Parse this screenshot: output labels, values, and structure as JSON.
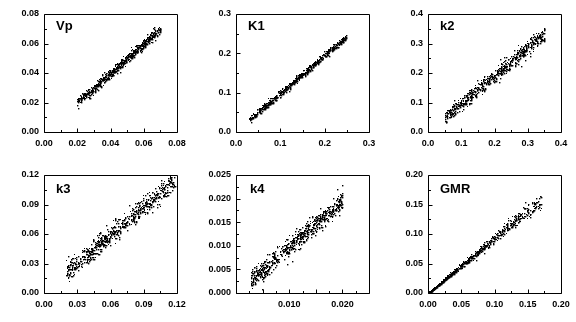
{
  "figure": {
    "kind": "scatter-panel-grid",
    "rows": 2,
    "cols": 3,
    "background": "#ffffff",
    "marker_color": "#000000",
    "axis_color": "#000000"
  },
  "chart_data": [
    {
      "type": "scatter",
      "title": "Vp",
      "xlabel": "",
      "ylabel": "",
      "grid": false,
      "legend": null,
      "xlim": [
        0.0,
        0.08
      ],
      "ylim": [
        0.0,
        0.08
      ],
      "xticks": [
        0.0,
        0.02,
        0.04,
        0.06,
        0.08
      ],
      "yticks": [
        0.0,
        0.02,
        0.04,
        0.06,
        0.08
      ],
      "xticklabels": [
        "0.00",
        "0.02",
        "0.04",
        "0.06",
        "0.08"
      ],
      "yticklabels": [
        "0.00",
        "0.02",
        "0.04",
        "0.06",
        "0.08"
      ],
      "minor_tick_subdivisions": 2,
      "data_x_range": [
        0.02,
        0.07
      ],
      "data_y_range": [
        0.022,
        0.07
      ],
      "slope": 1.0,
      "intercept": 0.0,
      "scatter_sigma": 0.0018,
      "n_points": 620,
      "seed": 11
    },
    {
      "type": "scatter",
      "title": "K1",
      "xlabel": "",
      "ylabel": "",
      "grid": false,
      "legend": null,
      "xlim": [
        0.0,
        0.3
      ],
      "ylim": [
        0.0,
        0.3
      ],
      "xticks": [
        0.0,
        0.1,
        0.2,
        0.3
      ],
      "yticks": [
        0.0,
        0.1,
        0.2,
        0.3
      ],
      "xticklabels": [
        "0.0",
        "0.1",
        "0.2",
        "0.3"
      ],
      "yticklabels": [
        "0.0",
        "0.1",
        "0.2",
        "0.3"
      ],
      "minor_tick_subdivisions": 2,
      "data_x_range": [
        0.03,
        0.248
      ],
      "data_y_range": [
        0.032,
        0.242
      ],
      "slope": 0.965,
      "intercept": 0.003,
      "scatter_sigma": 0.0042,
      "n_points": 620,
      "seed": 23
    },
    {
      "type": "scatter",
      "title": "k2",
      "xlabel": "",
      "ylabel": "",
      "grid": false,
      "legend": null,
      "xlim": [
        0.0,
        0.4
      ],
      "ylim": [
        0.0,
        0.4
      ],
      "xticks": [
        0.0,
        0.1,
        0.2,
        0.3,
        0.4
      ],
      "yticks": [
        0.0,
        0.1,
        0.2,
        0.3,
        0.4
      ],
      "xticklabels": [
        "0.0",
        "0.1",
        "0.2",
        "0.3",
        "0.4"
      ],
      "yticklabels": [
        "0.0",
        "0.1",
        "0.2",
        "0.3",
        "0.4"
      ],
      "minor_tick_subdivisions": 2,
      "data_x_range": [
        0.05,
        0.35
      ],
      "data_y_range": [
        0.05,
        0.33
      ],
      "slope": 0.945,
      "intercept": 0.004,
      "scatter_sigma": 0.0125,
      "n_points": 640,
      "seed": 37
    },
    {
      "type": "scatter",
      "title": "k3",
      "xlabel": "",
      "ylabel": "",
      "grid": false,
      "legend": null,
      "xlim": [
        0.0,
        0.12
      ],
      "ylim": [
        0.0,
        0.12
      ],
      "xticks": [
        0.0,
        0.03,
        0.06,
        0.09,
        0.12
      ],
      "yticks": [
        0.0,
        0.03,
        0.06,
        0.09,
        0.12
      ],
      "xticklabels": [
        "0.00",
        "0.03",
        "0.06",
        "0.09",
        "0.12"
      ],
      "yticklabels": [
        "0.00",
        "0.03",
        "0.06",
        "0.09",
        "0.12"
      ],
      "minor_tick_subdivisions": 2,
      "data_x_range": [
        0.02,
        0.118
      ],
      "data_y_range": [
        0.018,
        0.118
      ],
      "slope": 0.96,
      "intercept": 0.002,
      "scatter_sigma": 0.005,
      "n_points": 700,
      "seed": 53
    },
    {
      "type": "scatter",
      "title": "k4",
      "xlabel": "",
      "ylabel": "",
      "grid": false,
      "legend": null,
      "xlim": [
        0.0,
        0.025
      ],
      "ylim": [
        0.0,
        0.025
      ],
      "xticks": [
        0.0,
        0.005,
        0.01,
        0.015,
        0.02,
        0.025
      ],
      "yticks": [
        0.0,
        0.005,
        0.01,
        0.015,
        0.02,
        0.025
      ],
      "xticklabels": [
        "",
        "",
        "0.010",
        "",
        "0.020",
        ""
      ],
      "yticklabels": [
        "0.000",
        "0.005",
        "0.010",
        "0.015",
        "0.020",
        "0.025"
      ],
      "minor_tick_subdivisions": 2,
      "data_x_range": [
        0.0028,
        0.02
      ],
      "data_y_range": [
        0.0022,
        0.0195
      ],
      "slope": 0.97,
      "intercept": 0.0002,
      "scatter_sigma": 0.00105,
      "n_points": 680,
      "seed": 71
    },
    {
      "type": "scatter",
      "title": "GMR",
      "xlabel": "",
      "ylabel": "",
      "grid": false,
      "legend": null,
      "xlim": [
        0.0,
        0.2
      ],
      "ylim": [
        0.0,
        0.2
      ],
      "xticks": [
        0.0,
        0.05,
        0.1,
        0.15,
        0.2
      ],
      "yticks": [
        0.0,
        0.05,
        0.1,
        0.15,
        0.2
      ],
      "xticklabels": [
        "0.00",
        "0.05",
        "0.10",
        "0.15",
        "0.20"
      ],
      "yticklabels": [
        "0.00",
        "0.05",
        "0.10",
        "0.15",
        "0.20"
      ],
      "minor_tick_subdivisions": 2,
      "data_x_range": [
        0.0,
        0.17
      ],
      "data_y_range": [
        0.0,
        0.155
      ],
      "slope": 0.93,
      "intercept": 0.0,
      "scatter_sigma": 0.0012,
      "sigma_grows_with_x": true,
      "n_points": 760,
      "seed": 89
    }
  ],
  "panel_titles": [
    "Vp",
    "K1",
    "k2",
    "k3",
    "k4",
    "GMR"
  ]
}
